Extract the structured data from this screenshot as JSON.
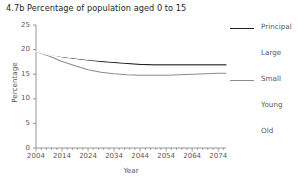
{
  "chart_data": {
    "type": "line",
    "title": "4.7b Percentage of population aged 0 to 15",
    "xlabel": "Year",
    "ylabel": "Percentage",
    "xlim": [
      2004,
      2077
    ],
    "ylim": [
      0,
      25
    ],
    "xticks": [
      "2004",
      "2014",
      "2024",
      "2034",
      "2044",
      "2054",
      "2064",
      "2074"
    ],
    "xtick_values": [
      2004,
      2014,
      2024,
      2034,
      2044,
      2054,
      2064,
      2074
    ],
    "yticks": [
      "0",
      "5",
      "10",
      "15",
      "20",
      "25"
    ],
    "ytick_values": [
      0,
      5,
      10,
      15,
      20,
      25
    ],
    "grid": false,
    "legend_position": "right",
    "x": [
      2004,
      2009,
      2014,
      2019,
      2024,
      2029,
      2034,
      2039,
      2044,
      2049,
      2054,
      2059,
      2064,
      2069,
      2074,
      2077
    ],
    "series": [
      {
        "name": "Principal",
        "color": "#231f20",
        "values": [
          19.6,
          19.0,
          18.5,
          18.2,
          17.9,
          17.6,
          17.4,
          17.2,
          17.0,
          16.9,
          16.9,
          16.9,
          16.9,
          16.9,
          16.9,
          16.9
        ]
      },
      {
        "name": "Large",
        "color": "#ffffff",
        "values": [
          19.6,
          19.0,
          18.6,
          18.3,
          18.0,
          17.8,
          17.6,
          17.4,
          17.3,
          17.2,
          17.2,
          17.2,
          17.2,
          17.2,
          17.2,
          17.2
        ]
      },
      {
        "name": "Small",
        "color": "#8c8c8c",
        "values": [
          19.6,
          18.7,
          17.6,
          16.7,
          15.9,
          15.4,
          15.1,
          14.9,
          14.8,
          14.8,
          14.8,
          14.9,
          15.0,
          15.1,
          15.2,
          15.2
        ]
      },
      {
        "name": "Young",
        "color": "#ffffff",
        "values": [
          19.6,
          19.1,
          18.7,
          18.4,
          18.2,
          18.0,
          17.9,
          17.8,
          17.7,
          17.7,
          17.7,
          17.7,
          17.7,
          17.7,
          17.7,
          17.7
        ]
      },
      {
        "name": "Old",
        "color": "#ffffff",
        "values": [
          19.6,
          18.9,
          18.3,
          17.9,
          17.5,
          17.2,
          17.0,
          16.8,
          16.7,
          16.6,
          16.6,
          16.6,
          16.6,
          16.6,
          16.6,
          16.6
        ]
      }
    ]
  },
  "legend": {
    "entries": [
      {
        "label": "Principal",
        "color": "#231f20",
        "visible_swatch": true
      },
      {
        "label": "Large",
        "color": "#ffffff",
        "visible_swatch": false
      },
      {
        "label": "Small",
        "color": "#8c8c8c",
        "visible_swatch": true
      },
      {
        "label": "Young",
        "color": "#ffffff",
        "visible_swatch": false
      },
      {
        "label": "Old",
        "color": "#ffffff",
        "visible_swatch": false
      }
    ]
  },
  "colors": {
    "text": "#231f20",
    "axis": "#8a8a8a",
    "tick_label": "#58595b",
    "background": "#ffffff"
  }
}
